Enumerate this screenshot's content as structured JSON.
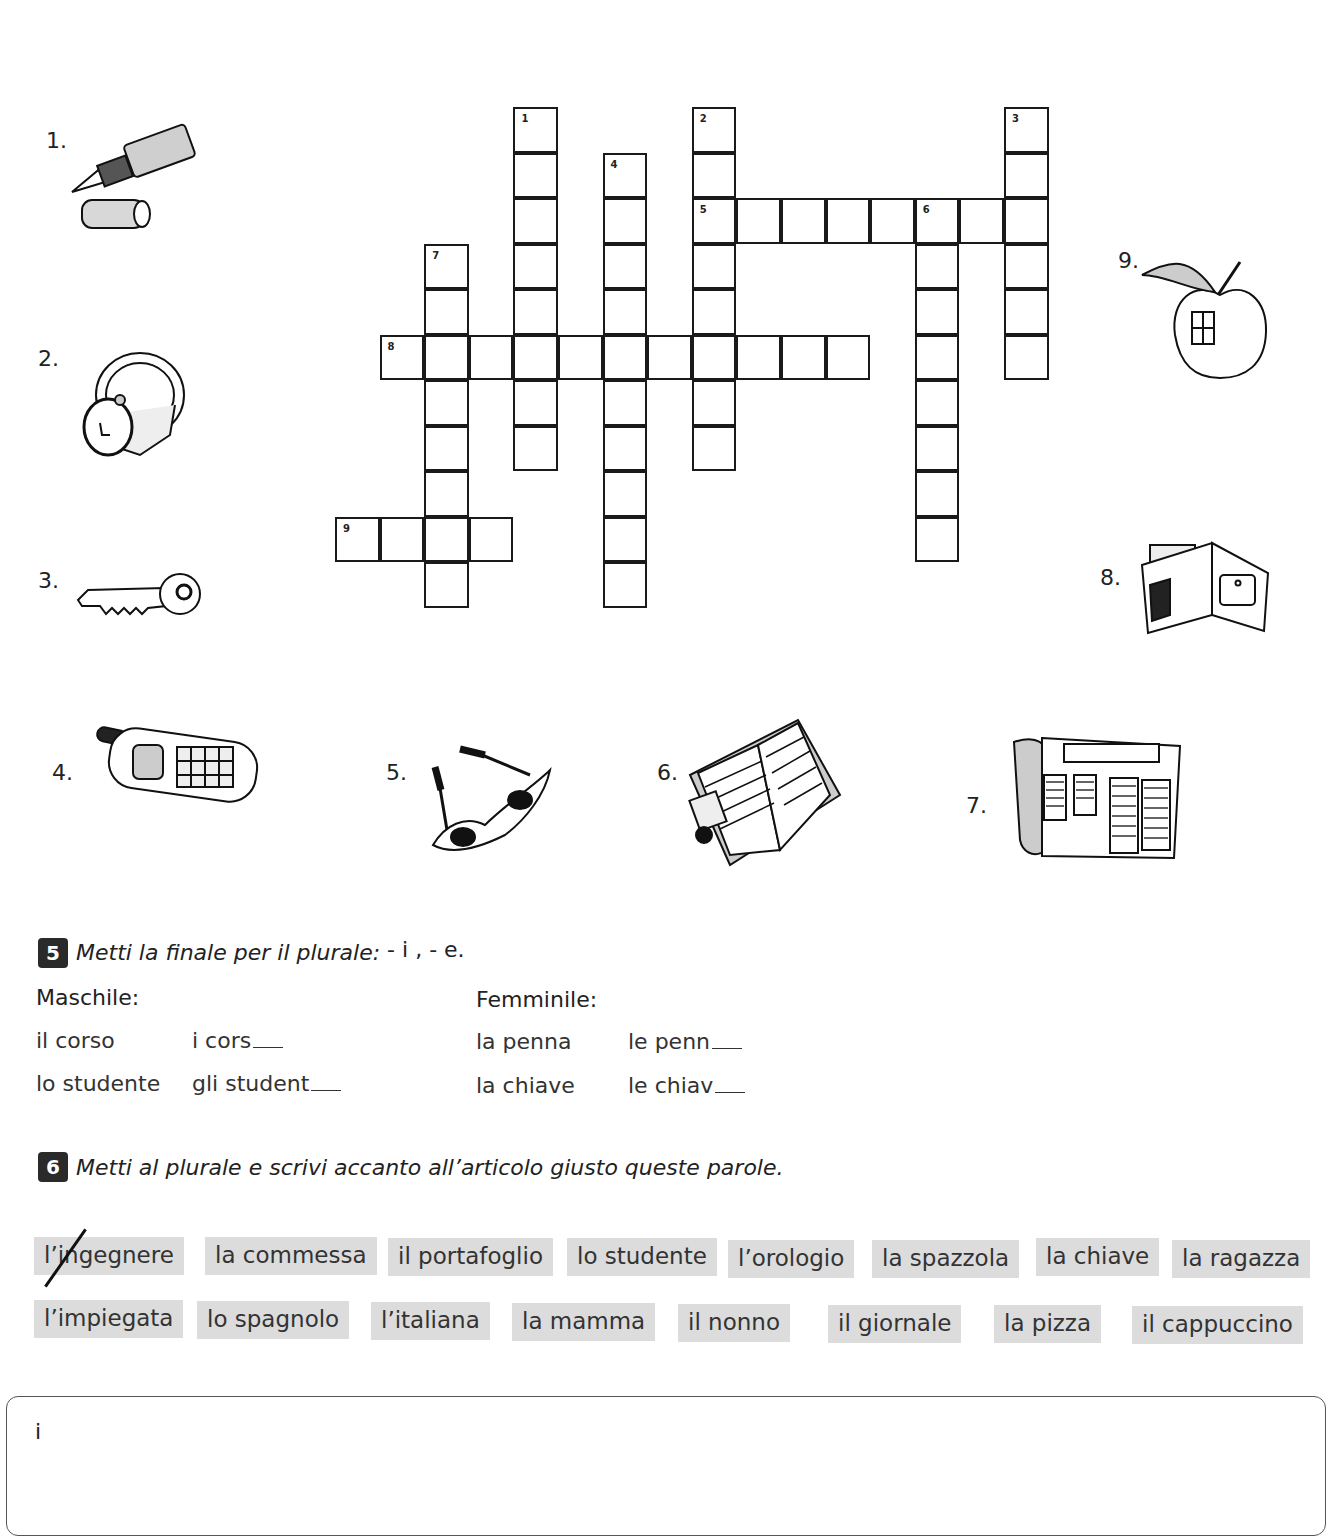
{
  "crossword": {
    "origin": {
      "x": 336,
      "y": 108
    },
    "cell_w": 44.6,
    "cell_h": 45.5,
    "entries": [
      {
        "number": "1",
        "direction": "down",
        "col": 4,
        "row": 0,
        "length": 8
      },
      {
        "number": "2",
        "direction": "down",
        "col": 8,
        "row": 0,
        "length": 8
      },
      {
        "number": "3",
        "direction": "down",
        "col": 15,
        "row": 0,
        "length": 6
      },
      {
        "number": "4",
        "direction": "down",
        "col": 6,
        "row": 1,
        "length": 10
      },
      {
        "number": "5",
        "direction": "across",
        "col": 8,
        "row": 2,
        "length": 8
      },
      {
        "number": "6",
        "direction": "down",
        "col": 13,
        "row": 2,
        "length": 8
      },
      {
        "number": "7",
        "direction": "down",
        "col": 2,
        "row": 3,
        "length": 8
      },
      {
        "number": "8",
        "direction": "across",
        "col": 1,
        "row": 5,
        "length": 11
      },
      {
        "number": "9",
        "direction": "across",
        "col": 0,
        "row": 9,
        "length": 4
      }
    ]
  },
  "pictures": [
    {
      "label": "1.",
      "icon": "fountain-pen-icon",
      "desc": "penna"
    },
    {
      "label": "2.",
      "icon": "wristwatch-icon",
      "desc": "orologio"
    },
    {
      "label": "3.",
      "icon": "key-icon",
      "desc": "chiave"
    },
    {
      "label": "4.",
      "icon": "mobile-phone-icon",
      "desc": "telefonino"
    },
    {
      "label": "5.",
      "icon": "glasses-icon",
      "desc": "occhiali"
    },
    {
      "label": "6.",
      "icon": "agenda-icon",
      "desc": "agenda"
    },
    {
      "label": "7.",
      "icon": "newspaper-icon",
      "desc": "giornale"
    },
    {
      "label": "8.",
      "icon": "wallet-icon",
      "desc": "portafoglio"
    },
    {
      "label": "9.",
      "icon": "apple-icon",
      "desc": "mela"
    }
  ],
  "exercise5": {
    "number": "5",
    "instruction": "Metti la finale per il plurale:",
    "endings": " - i , - e.",
    "maschile": {
      "heading": "Maschile:",
      "rows": [
        {
          "singular": "il corso",
          "plural": "i cors"
        },
        {
          "singular": "lo studente",
          "plural": "gli student"
        }
      ]
    },
    "femminile": {
      "heading": "Femminile:",
      "rows": [
        {
          "singular": "la penna",
          "plural": "le penn"
        },
        {
          "singular": "la chiave",
          "plural": "le chiav"
        }
      ]
    }
  },
  "exercise6": {
    "number": "6",
    "instruction": "Metti al plurale e scrivi accanto all’articolo giusto queste parole.",
    "row1": [
      "l’ingegnere",
      "la commessa",
      "il portafoglio",
      "lo studente",
      "l’orologio",
      "la spazzola",
      "la chiave",
      "la ragazza"
    ],
    "row2": [
      "l’impiegata",
      "lo spagnolo",
      "l’italiana",
      "la mamma",
      "il nonno",
      "il giornale",
      "la pizza",
      "il cappuccino"
    ],
    "crossed_out": "l’ingegnere",
    "tag_color": "#dcdcdc"
  },
  "answer_box": {
    "label": "i"
  }
}
